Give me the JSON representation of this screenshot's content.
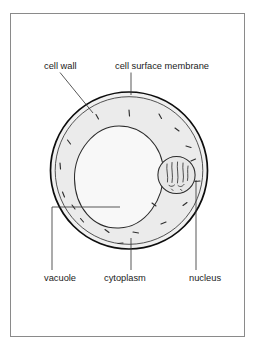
{
  "figure": {
    "frame": {
      "border_color": "#8a8a8a",
      "background": "#ffffff",
      "x": 10,
      "y": 13,
      "width": 235,
      "height": 324
    },
    "labels": [
      {
        "id": "cell-wall",
        "text": "cell wall",
        "x": 44,
        "y": 69,
        "anchor": "start"
      },
      {
        "id": "cell-surface-membrane",
        "text": "cell surface membrane",
        "x": 115,
        "y": 69,
        "anchor": "start"
      },
      {
        "id": "vacuole",
        "text": "vacuole",
        "x": 44,
        "y": 281,
        "anchor": "start"
      },
      {
        "id": "cytoplasm",
        "text": "cytoplasm",
        "x": 104,
        "y": 281,
        "anchor": "start"
      },
      {
        "id": "nucleus",
        "text": "nucleus",
        "x": 189,
        "y": 281,
        "anchor": "start"
      }
    ],
    "structures": {
      "cell_wall": {
        "cx": 129,
        "cy": 170.5,
        "r": 78.5,
        "stroke": "#111111",
        "stroke_width": 1.5,
        "fill": "#efefef"
      },
      "cell_membrane": {
        "cx": 129,
        "cy": 170.5,
        "r": 73.5,
        "stroke": "#3a3a3a",
        "stroke_width": 0.9,
        "fill": "#ececec"
      },
      "vacuole": {
        "cx": 118,
        "cy": 177,
        "rx": 45,
        "ry": 51,
        "stroke": "#2b2b2b",
        "stroke_width": 1.0,
        "fill": "#f7f7f7"
      },
      "nucleus": {
        "cx": 176.5,
        "cy": 175,
        "r": 18.5,
        "stroke": "#2b2b2b",
        "stroke_width": 1.0,
        "fill": "#e8e8e8"
      }
    },
    "leader_lines": [
      {
        "id": "cell-wall-leader",
        "type": "diagonal",
        "points": "60,72 93,113"
      },
      {
        "id": "cell-surface-membrane-leader",
        "type": "vertical",
        "points": "131,72 131,96"
      },
      {
        "id": "vacuole-leader",
        "type": "elbow",
        "points": "52,270 52,207 120,207"
      },
      {
        "id": "cytoplasm-leader",
        "type": "vertical",
        "points": "131,270 131,238"
      },
      {
        "id": "nucleus-leader",
        "type": "vertical",
        "points": "196,270 196,180"
      }
    ],
    "organelles_note": "short dark dashes in cytoplasm representing chloroplasts/organelles",
    "chromatin_note": "wavy threads inside nucleus"
  }
}
